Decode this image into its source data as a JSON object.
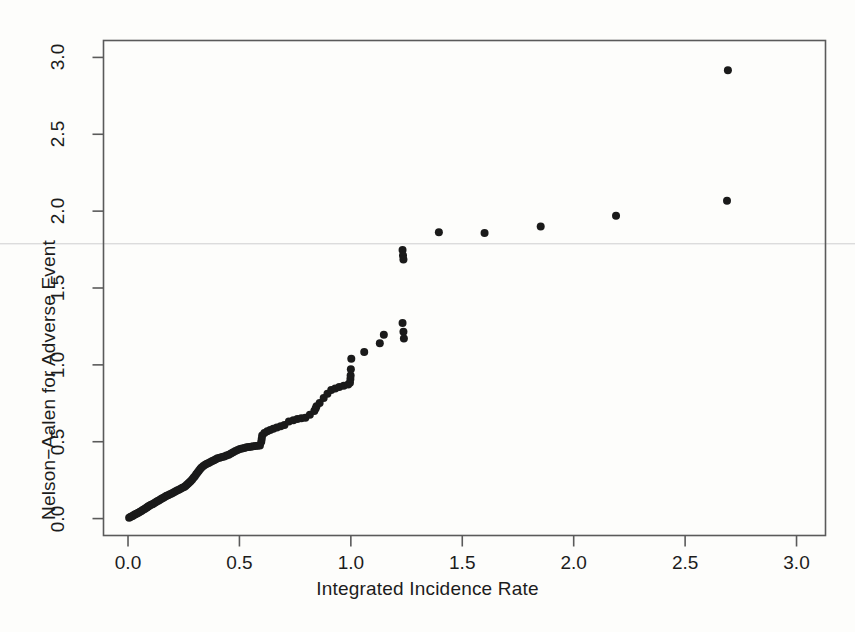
{
  "figure": {
    "background_color": "#fdfdfb",
    "point_color": "#1a1a1a",
    "axis_color": "#5a5a5a"
  },
  "chart_data": {
    "type": "scatter",
    "title": "",
    "xlabel": "Integrated Incidence Rate",
    "ylabel": "Nelson−Aalen for Adverse Event",
    "xlim": [
      -0.11,
      3.13
    ],
    "ylim": [
      -0.11,
      3.11
    ],
    "xticks": [
      0.0,
      0.5,
      1.0,
      1.5,
      2.0,
      2.5,
      3.0
    ],
    "yticks": [
      0.0,
      0.5,
      1.0,
      1.5,
      2.0,
      2.5,
      3.0
    ],
    "xticklabels": [
      "0.0",
      "0.5",
      "1.0",
      "1.5",
      "2.0",
      "2.5",
      "3.0"
    ],
    "yticklabels": [
      "0.0",
      "0.5",
      "1.0",
      "1.5",
      "2.0",
      "2.5",
      "3.0"
    ],
    "grid": false,
    "legend": null,
    "marker": "filled-circle",
    "marker_size_px": 8,
    "points": [
      [
        0.005,
        0.005
      ],
      [
        0.012,
        0.012
      ],
      [
        0.018,
        0.015
      ],
      [
        0.024,
        0.02
      ],
      [
        0.03,
        0.026
      ],
      [
        0.036,
        0.03
      ],
      [
        0.042,
        0.035
      ],
      [
        0.048,
        0.04
      ],
      [
        0.054,
        0.045
      ],
      [
        0.06,
        0.05
      ],
      [
        0.066,
        0.056
      ],
      [
        0.072,
        0.06
      ],
      [
        0.078,
        0.066
      ],
      [
        0.084,
        0.072
      ],
      [
        0.09,
        0.078
      ],
      [
        0.096,
        0.084
      ],
      [
        0.103,
        0.09
      ],
      [
        0.11,
        0.094
      ],
      [
        0.117,
        0.1
      ],
      [
        0.124,
        0.106
      ],
      [
        0.131,
        0.112
      ],
      [
        0.138,
        0.118
      ],
      [
        0.145,
        0.124
      ],
      [
        0.152,
        0.13
      ],
      [
        0.159,
        0.136
      ],
      [
        0.166,
        0.142
      ],
      [
        0.173,
        0.148
      ],
      [
        0.18,
        0.152
      ],
      [
        0.188,
        0.158
      ],
      [
        0.196,
        0.164
      ],
      [
        0.204,
        0.17
      ],
      [
        0.212,
        0.176
      ],
      [
        0.22,
        0.182
      ],
      [
        0.228,
        0.188
      ],
      [
        0.236,
        0.194
      ],
      [
        0.244,
        0.2
      ],
      [
        0.252,
        0.206
      ],
      [
        0.258,
        0.212
      ],
      [
        0.264,
        0.22
      ],
      [
        0.27,
        0.228
      ],
      [
        0.276,
        0.236
      ],
      [
        0.282,
        0.245
      ],
      [
        0.288,
        0.255
      ],
      [
        0.294,
        0.265
      ],
      [
        0.3,
        0.276
      ],
      [
        0.306,
        0.288
      ],
      [
        0.312,
        0.3
      ],
      [
        0.318,
        0.312
      ],
      [
        0.324,
        0.322
      ],
      [
        0.33,
        0.332
      ],
      [
        0.338,
        0.342
      ],
      [
        0.346,
        0.35
      ],
      [
        0.354,
        0.356
      ],
      [
        0.362,
        0.362
      ],
      [
        0.37,
        0.368
      ],
      [
        0.378,
        0.374
      ],
      [
        0.386,
        0.38
      ],
      [
        0.394,
        0.386
      ],
      [
        0.402,
        0.392
      ],
      [
        0.412,
        0.396
      ],
      [
        0.422,
        0.4
      ],
      [
        0.432,
        0.404
      ],
      [
        0.442,
        0.41
      ],
      [
        0.452,
        0.416
      ],
      [
        0.462,
        0.424
      ],
      [
        0.472,
        0.432
      ],
      [
        0.482,
        0.44
      ],
      [
        0.492,
        0.446
      ],
      [
        0.502,
        0.452
      ],
      [
        0.512,
        0.456
      ],
      [
        0.522,
        0.46
      ],
      [
        0.532,
        0.464
      ],
      [
        0.542,
        0.466
      ],
      [
        0.552,
        0.468
      ],
      [
        0.562,
        0.47
      ],
      [
        0.572,
        0.472
      ],
      [
        0.582,
        0.474
      ],
      [
        0.592,
        0.476
      ],
      [
        0.598,
        0.5
      ],
      [
        0.6,
        0.52
      ],
      [
        0.602,
        0.54
      ],
      [
        0.612,
        0.556
      ],
      [
        0.625,
        0.568
      ],
      [
        0.638,
        0.576
      ],
      [
        0.652,
        0.584
      ],
      [
        0.668,
        0.592
      ],
      [
        0.685,
        0.6
      ],
      [
        0.702,
        0.608
      ],
      [
        0.722,
        0.632
      ],
      [
        0.742,
        0.64
      ],
      [
        0.76,
        0.648
      ],
      [
        0.778,
        0.652
      ],
      [
        0.796,
        0.656
      ],
      [
        0.816,
        0.676
      ],
      [
        0.836,
        0.7
      ],
      [
        0.842,
        0.716
      ],
      [
        0.846,
        0.73
      ],
      [
        0.86,
        0.752
      ],
      [
        0.878,
        0.784
      ],
      [
        0.895,
        0.812
      ],
      [
        0.912,
        0.836
      ],
      [
        0.93,
        0.846
      ],
      [
        0.948,
        0.856
      ],
      [
        0.968,
        0.864
      ],
      [
        0.988,
        0.872
      ],
      [
        0.996,
        0.884
      ],
      [
        0.998,
        0.908
      ],
      [
        0.999,
        0.93
      ],
      [
        1.0,
        0.972
      ],
      [
        1.002,
        1.04
      ],
      [
        1.06,
        1.084
      ],
      [
        1.13,
        1.14
      ],
      [
        1.148,
        1.196
      ],
      [
        1.232,
        1.272
      ],
      [
        1.236,
        1.216
      ],
      [
        1.238,
        1.172
      ],
      [
        1.232,
        1.748
      ],
      [
        1.234,
        1.712
      ],
      [
        1.236,
        1.686
      ],
      [
        1.395,
        1.862
      ],
      [
        1.6,
        1.858
      ],
      [
        1.852,
        1.9
      ],
      [
        2.19,
        1.97
      ],
      [
        2.688,
        2.068
      ],
      [
        2.692,
        2.916
      ]
    ],
    "notes": [
      "Dense overlapping cluster of points along the diagonal from (0,0) to about (1.0,0.9)",
      "Vertical stack of three points near x=1.23 between y=1.69 and y=1.75",
      "Sparse points spread to the upper right, flattening near y=1.86-2.07",
      "Single high outlier at approximately (2.69, 2.92)"
    ]
  }
}
